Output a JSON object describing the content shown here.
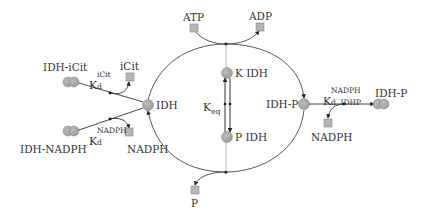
{
  "diagram": {
    "colors": {
      "line": "#444444",
      "node_fill": "#a6a6a6",
      "node_stroke": "#8c8c8c",
      "small_molecule_fill": "#b5b5b5",
      "text": "#333333"
    },
    "nodes": {
      "atp": {
        "label": "ATP",
        "shape": "square"
      },
      "adp": {
        "label": "ADP",
        "shape": "square"
      },
      "p": {
        "label": "P",
        "shape": "square"
      },
      "icit": {
        "label": "iCit",
        "shape": "square"
      },
      "nadph_left": {
        "label": "NADPH",
        "shape": "square"
      },
      "nadph_right": {
        "label": "NADPH",
        "shape": "square"
      },
      "idh": {
        "label": "IDH",
        "shape": "circle"
      },
      "idh_p": {
        "label": "IDH-P",
        "shape": "circle"
      },
      "k_idh": {
        "label": "K IDH",
        "shape": "circle"
      },
      "p_idh": {
        "label": "P IDH",
        "shape": "circle"
      },
      "idh_icit": {
        "label": "IDH-iCit",
        "shape": "dimer"
      },
      "idh_nadph": {
        "label": "IDH-NADPH",
        "shape": "dimer"
      },
      "idh_p_complex": {
        "label": "IDH-P",
        "shape": "dimer"
      }
    },
    "constants": {
      "kd_icit": {
        "main": "K",
        "sup": "iCit",
        "sub": "d"
      },
      "kd_nadph": {
        "main": "K",
        "sup": "NADPH",
        "sub": "d"
      },
      "kd_nadph_idhp": {
        "main": "K",
        "sup": "NADPH",
        "sub": "d, IDHP"
      },
      "keq": {
        "main": "K",
        "sub": "eq"
      }
    }
  }
}
